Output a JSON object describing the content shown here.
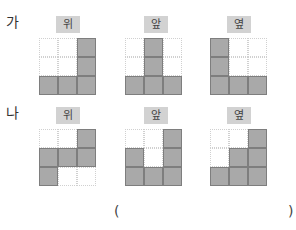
{
  "problems": [
    {
      "label": "가",
      "views": [
        {
          "name": "위",
          "grid": [
            [
              0,
              0,
              1
            ],
            [
              0,
              0,
              1
            ],
            [
              1,
              1,
              1
            ]
          ]
        },
        {
          "name": "앞",
          "grid": [
            [
              0,
              1,
              0
            ],
            [
              0,
              1,
              0
            ],
            [
              1,
              1,
              1
            ]
          ]
        },
        {
          "name": "옆",
          "grid": [
            [
              1,
              0,
              0
            ],
            [
              1,
              0,
              0
            ],
            [
              1,
              1,
              1
            ]
          ]
        }
      ]
    },
    {
      "label": "나",
      "views": [
        {
          "name": "위",
          "grid": [
            [
              0,
              0,
              1
            ],
            [
              1,
              1,
              1
            ],
            [
              1,
              0,
              0
            ]
          ]
        },
        {
          "name": "앞",
          "grid": [
            [
              0,
              0,
              1
            ],
            [
              1,
              0,
              1
            ],
            [
              1,
              1,
              1
            ]
          ]
        },
        {
          "name": "옆",
          "grid": [
            [
              0,
              0,
              1
            ],
            [
              0,
              1,
              1
            ],
            [
              1,
              1,
              1
            ]
          ]
        }
      ]
    }
  ],
  "answer": {
    "open_paren": "(",
    "close_paren": ")",
    "value": ""
  },
  "colors": {
    "filled": "#a9a9a9",
    "label_bg": "#d2d2d2"
  }
}
